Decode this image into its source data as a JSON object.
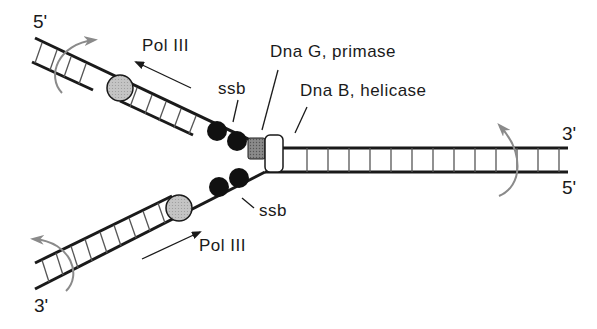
{
  "diagram": {
    "colors": {
      "strand": "#1a1a1a",
      "rotation_arrow": "#8a8a8a",
      "pol3": "#bdbdbd",
      "primase": "#808080",
      "ssb": "#111111",
      "helicase": "#ffffff"
    },
    "strand_ends": {
      "top_left": "5'",
      "bottom_left": "3'",
      "right_top": "3'",
      "right_bottom": "5'"
    },
    "labels": {
      "pol3_top": "Pol III",
      "pol3_bottom": "Pol III",
      "ssb_top": "ssb",
      "ssb_bottom": "ssb",
      "primase": "Dna G, primase",
      "helicase": "Dna B, helicase"
    },
    "components": [
      {
        "name": "Pol III (lagging strand)",
        "shape": "circle",
        "color": "gray"
      },
      {
        "name": "Pol III (leading strand)",
        "shape": "circle",
        "color": "gray"
      },
      {
        "name": "ssb",
        "shape": "black dots",
        "count_top": 2,
        "count_bottom": 2
      },
      {
        "name": "Dna G, primase",
        "shape": "square",
        "color": "dark gray"
      },
      {
        "name": "Dna B, helicase",
        "shape": "rounded rectangle",
        "color": "white"
      }
    ]
  }
}
